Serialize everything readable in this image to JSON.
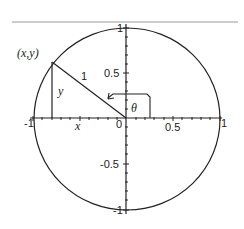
{
  "diagram": {
    "type": "unit-circle-trigonometry",
    "colors": {
      "stroke": "#222222",
      "top_rule": "#888888",
      "background": "#ffffff"
    },
    "axes": {
      "x_ticks": [
        {
          "value": -1,
          "label": "-1"
        },
        {
          "value": 0,
          "label": "0"
        },
        {
          "value": 0.5,
          "label": "0.5"
        },
        {
          "value": 1,
          "label": "1"
        }
      ],
      "y_ticks": [
        {
          "value": 1,
          "label": "1"
        },
        {
          "value": 0.5,
          "label": "0.5"
        },
        {
          "value": -0.5,
          "label": "-0.5"
        },
        {
          "value": -1,
          "label": "-1"
        }
      ]
    },
    "labels": {
      "point": "(x,y)",
      "hypotenuse": "1",
      "vertical_leg": "y",
      "horizontal_leg": "x",
      "angle": "θ"
    },
    "point": {
      "x": -0.81,
      "y": 0.62
    }
  }
}
